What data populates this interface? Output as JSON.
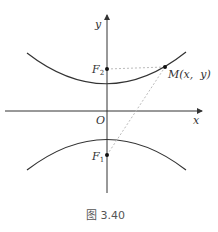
{
  "figure": {
    "caption": "图 3.40",
    "axes": {
      "x_label": "x",
      "y_label": "y",
      "origin_label": "O"
    },
    "points": {
      "F1": {
        "name": "F",
        "sub": "1"
      },
      "F2": {
        "name": "F",
        "sub": "2"
      },
      "M": {
        "label": "M(x,  y)"
      }
    },
    "curve": "hyperbola with foci on y-axis (two branches)",
    "colors": {
      "curve": "#333333",
      "axis": "#333333",
      "dashed": "#bbbbbb"
    }
  }
}
